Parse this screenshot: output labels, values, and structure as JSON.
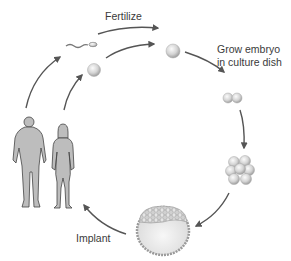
{
  "diagram": {
    "labels": {
      "fertilize": "Fertilize",
      "grow_line1": "Grow embryo",
      "grow_line2": "in culture dish",
      "implant": "Implant"
    },
    "stages": [
      {
        "id": "parents",
        "name": "Man and woman"
      },
      {
        "id": "sperm",
        "name": "Sperm"
      },
      {
        "id": "egg",
        "name": "Egg"
      },
      {
        "id": "zygote",
        "name": "Fertilized egg"
      },
      {
        "id": "two-cell",
        "name": "Two-cell embryo"
      },
      {
        "id": "morula",
        "name": "Multi-cell embryo"
      },
      {
        "id": "blastocyst",
        "name": "Blastocyst"
      }
    ],
    "colors": {
      "arrow": "#555555",
      "figure_fill": "#bdbdbd",
      "figure_stroke": "#444444",
      "cell_light": "#f2f2f2",
      "cell_dark": "#a8a8a8",
      "text": "#3a3a3a"
    }
  }
}
